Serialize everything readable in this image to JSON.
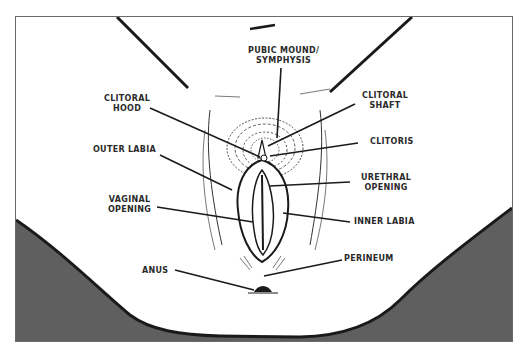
{
  "diagram": {
    "type": "anatomical labeled illustration",
    "colors": {
      "background": "#ffffff",
      "frame_border": "#6a6a6a",
      "shadow_fill": "#5f5f5f",
      "outline": "#1a1a1a",
      "label_text": "#2a2a2a"
    },
    "labels": {
      "pubic_mound": [
        "PUBIC MOUND/",
        "SYMPHYSIS"
      ],
      "clitoral_hood": [
        "CLITORAL",
        "HOOD"
      ],
      "clitoral_shaft": [
        "CLITORAL",
        "SHAFT"
      ],
      "clitoris": [
        "CLITORIS"
      ],
      "outer_labia": [
        "OUTER LABIA"
      ],
      "urethral_opening": [
        "URETHRAL",
        "OPENING"
      ],
      "vaginal_opening": [
        "VAGINAL",
        "OPENING"
      ],
      "inner_labia": [
        "INNER LABIA"
      ],
      "perineum": [
        "PERINEUM"
      ],
      "anus": [
        "ANUS"
      ]
    }
  }
}
